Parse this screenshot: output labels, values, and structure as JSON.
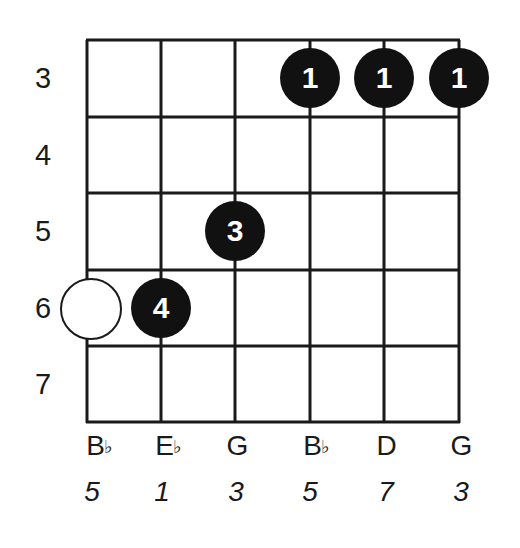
{
  "diagram": {
    "type": "guitar-chord-diagram",
    "frets": [
      "3",
      "4",
      "5",
      "6",
      "7"
    ],
    "strings": [
      {
        "note": "B",
        "accidental": "♭",
        "interval": "5"
      },
      {
        "note": "E",
        "accidental": "♭",
        "interval": "1"
      },
      {
        "note": "G",
        "accidental": "",
        "interval": "3"
      },
      {
        "note": "B",
        "accidental": "♭",
        "interval": "5"
      },
      {
        "note": "D",
        "accidental": "",
        "interval": "7"
      },
      {
        "note": "G",
        "accidental": "",
        "interval": "3"
      }
    ],
    "fingers": [
      {
        "string": 4,
        "fret": "3",
        "finger": "1"
      },
      {
        "string": 5,
        "fret": "3",
        "finger": "1"
      },
      {
        "string": 6,
        "fret": "3",
        "finger": "1"
      },
      {
        "string": 3,
        "fret": "5",
        "finger": "3"
      },
      {
        "string": 2,
        "fret": "6",
        "finger": "4"
      }
    ],
    "optional_notes": [
      {
        "string": 1,
        "fret": "6",
        "style": "open-circle"
      }
    ],
    "colors": {
      "line": "#1a1a1a",
      "dot": "#111111",
      "dot_text": "#ffffff",
      "background": "#ffffff"
    }
  }
}
